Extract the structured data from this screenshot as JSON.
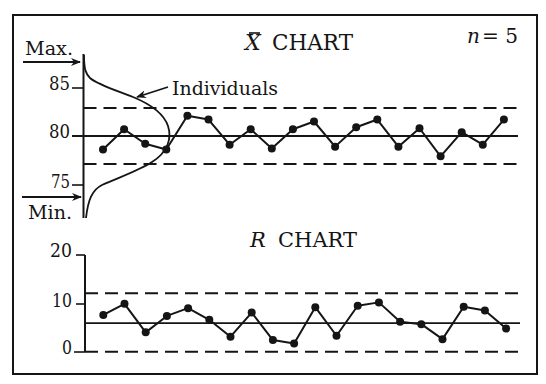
{
  "figure": {
    "xbar_title_symbol": "X",
    "xbar_title_text": "CHART",
    "sample_size_symbol": "n",
    "sample_size_value": "= 5",
    "r_title_symbol": "R",
    "r_title_text": "CHART",
    "max_label": "Max.",
    "min_label": "Min.",
    "individuals_label": "Individuals",
    "xbar_ticks": [
      "85",
      "80",
      "75"
    ],
    "r_ticks": [
      "20",
      "10",
      "0"
    ]
  },
  "chart_data": [
    {
      "type": "line",
      "title": "X̄ CHART",
      "annotation": "n = 5",
      "xlabel": "",
      "ylabel": "",
      "yticks": [
        75,
        80,
        85
      ],
      "ylim": [
        71.5,
        88.5
      ],
      "grid": false,
      "x": [
        1,
        2,
        3,
        4,
        5,
        6,
        7,
        8,
        9,
        10,
        11,
        12,
        13,
        14,
        15,
        16,
        17,
        18,
        19,
        20
      ],
      "series": [
        {
          "name": "Sample means",
          "values": [
            78.6,
            80.7,
            79.2,
            78.6,
            82.1,
            81.7,
            79.1,
            80.7,
            78.7,
            80.7,
            81.5,
            78.9,
            80.9,
            81.7,
            78.9,
            80.8,
            77.9,
            80.4,
            79.1,
            81.7
          ]
        }
      ],
      "center_line": 80.0,
      "upper_control_limit": 82.9,
      "lower_control_limit": 77.1,
      "overlay": {
        "label": "Individuals",
        "shape": "normal distribution curve centered at 80, spanning Max. to Min."
      },
      "side_annotations": [
        "Max.",
        "Min."
      ]
    },
    {
      "type": "line",
      "title": "R CHART",
      "xlabel": "",
      "ylabel": "",
      "yticks": [
        0,
        10,
        20
      ],
      "ylim": [
        0,
        20
      ],
      "grid": false,
      "x": [
        1,
        2,
        3,
        4,
        5,
        6,
        7,
        8,
        9,
        10,
        11,
        12,
        13,
        14,
        15,
        16,
        17,
        18,
        19,
        20
      ],
      "series": [
        {
          "name": "Sample ranges",
          "values": [
            7.6,
            9.9,
            4.0,
            7.4,
            9.0,
            6.6,
            3.1,
            8.1,
            2.4,
            1.7,
            9.2,
            3.3,
            9.5,
            10.2,
            6.2,
            5.7,
            2.6,
            9.3,
            8.5,
            4.8
          ]
        }
      ],
      "center_line": 5.9,
      "upper_control_limit": 12.1,
      "lower_control_limit": 0
    }
  ]
}
